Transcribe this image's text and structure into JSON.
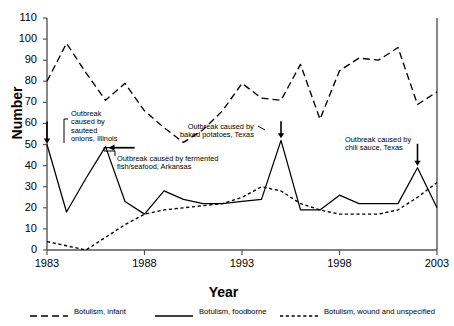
{
  "chart_data": {
    "type": "line",
    "title": "",
    "xlabel": "Year",
    "ylabel": "Number",
    "xlim": [
      1983,
      2003
    ],
    "ylim": [
      0,
      110
    ],
    "ytick_step": 10,
    "yticks": [
      0,
      10,
      20,
      30,
      40,
      50,
      60,
      70,
      80,
      90,
      100,
      110
    ],
    "xticks": [
      1983,
      1988,
      1993,
      1998,
      2003
    ],
    "grid": false,
    "legend_position": "bottom",
    "x": [
      1983,
      1984,
      1985,
      1986,
      1987,
      1988,
      1989,
      1990,
      1991,
      1992,
      1993,
      1994,
      1995,
      1996,
      1997,
      1998,
      1999,
      2000,
      2001,
      2002,
      2003
    ],
    "series": [
      {
        "name": "Botulism, infant",
        "style": "long-dash",
        "values": [
          80,
          98,
          84,
          71,
          79,
          66,
          58,
          51,
          57,
          66,
          79,
          72,
          71,
          88,
          62,
          85,
          91,
          90,
          96,
          69,
          75
        ]
      },
      {
        "name": "Botulism, foodborne",
        "style": "solid",
        "values": [
          50,
          18,
          34,
          49,
          23,
          17,
          28,
          24,
          22,
          22,
          23,
          24,
          52,
          19,
          19,
          26,
          22,
          22,
          22,
          39,
          20
        ]
      },
      {
        "name": "Botulism, wound and unspecified",
        "style": "short-dash",
        "values": [
          4,
          2,
          0,
          6,
          12,
          17,
          19,
          20,
          21,
          22,
          25,
          30,
          28,
          22,
          19,
          17,
          17,
          17,
          19,
          25,
          32
        ]
      }
    ],
    "annotations": [
      {
        "id": "sauteed-onions",
        "text": "Outbreak\ncaused by\nsauteed\nonions, Illinois",
        "target_year": 1983,
        "target_value": 50
      },
      {
        "id": "fermented-fish",
        "text": "Outbreak caused by fermented\nfish/seafood, Arkansas",
        "target_year": 1986,
        "target_value": 49
      },
      {
        "id": "baked-potatoes",
        "text": "Outbreak caused by\nbaked potatoes, Texas",
        "target_year": 1995,
        "target_value": 52
      },
      {
        "id": "chili-sauce",
        "text": "Outbreak caused by\nchili sauce, Texas",
        "target_year": 2002,
        "target_value": 39
      }
    ]
  },
  "axis": {
    "ylabel": "Number",
    "xlabel": "Year",
    "yticks": [
      "0",
      "10",
      "20",
      "30",
      "40",
      "50",
      "60",
      "70",
      "80",
      "90",
      "100",
      "110"
    ],
    "xticks": [
      "1983",
      "1988",
      "1993",
      "1998",
      "2003"
    ]
  },
  "legend": {
    "items": [
      {
        "label": "Botulism, infant",
        "style": "long-dash"
      },
      {
        "label": "Botulism, foodborne",
        "style": "solid"
      },
      {
        "label": "Botulism, wound and unspecified",
        "style": "short-dash"
      }
    ]
  },
  "annotations": {
    "sauteed_onions": "Outbreak\ncaused by\nsauteed\nonions, Illinois",
    "fermented_fish": "Outbreak caused by fermented\nfish/seafood, Arkansas",
    "baked_potatoes": "Outbreak caused by\nbaked potatoes, Texas",
    "chili_sauce": "Outbreak caused by\nchili sauce, Texas"
  },
  "colors": {
    "line": "#000000",
    "axis": "#555555",
    "background": "#ffffff"
  }
}
